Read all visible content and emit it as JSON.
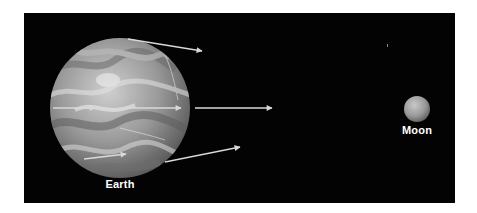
{
  "diagram": {
    "type": "earth-moon-tidal-forces",
    "background_color": "#030303",
    "page_color": "#ffffff",
    "arrow_color": "#d8d8d8",
    "bodies": [
      {
        "id": "earth",
        "label": "Earth",
        "cx": 120,
        "cy": 108,
        "r": 70
      },
      {
        "id": "moon",
        "label": "Moon",
        "cx": 417,
        "cy": 109,
        "r": 13
      }
    ],
    "arrows": [
      {
        "id": "top-external",
        "x1": 128,
        "y1": 39,
        "x2": 202,
        "y2": 51
      },
      {
        "id": "center-left-internal",
        "x1": 53,
        "y1": 108,
        "x2": 95,
        "y2": 108
      },
      {
        "id": "center-right-internal",
        "x1": 125,
        "y1": 108,
        "x2": 181,
        "y2": 108
      },
      {
        "id": "center-external",
        "x1": 195,
        "y1": 108,
        "x2": 272,
        "y2": 108
      },
      {
        "id": "lower-internal",
        "x1": 84,
        "y1": 159,
        "x2": 126,
        "y2": 154
      },
      {
        "id": "bottom-external",
        "x1": 165,
        "y1": 162,
        "x2": 240,
        "y2": 147
      }
    ]
  },
  "labels": {
    "earth": "Earth",
    "moon": "Moon"
  }
}
